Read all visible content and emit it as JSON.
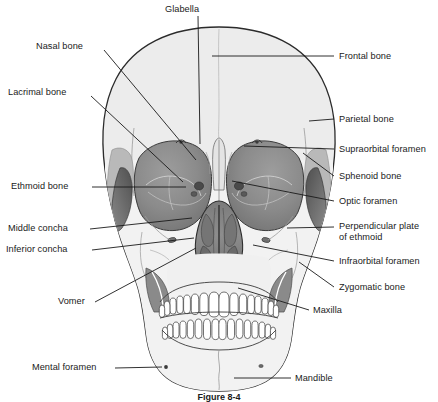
{
  "figure": {
    "caption": "Figure  8-4",
    "caption_cont": ""
  },
  "colors": {
    "outline": "#2b2b2b",
    "cranium_fill": "#ececec",
    "face_fill": "#f1f1f1",
    "orbit_fill": "#8e8e8e",
    "orbit_fill_dark": "#6f6f6f",
    "nasal_fill": "#8a8a8a",
    "nasal_fill_dark": "#5f5f5f",
    "sphenoid_fill": "#6b6b6b",
    "suture": "#9a9a9a",
    "leader": "#1a1a1a",
    "text": "#1a1a1a",
    "tooth_fill": "#ffffff"
  },
  "labels": [
    {
      "id": "glabella",
      "text": "Glabella",
      "side": "center",
      "x": 165,
      "y": 4,
      "lx": 198,
      "ly": 16,
      "tx": 200,
      "ty": 144
    },
    {
      "id": "nasal-bone",
      "text": "Nasal bone",
      "side": "left",
      "x": 36,
      "y": 41,
      "lx": 104,
      "ly": 50,
      "tx": 196,
      "ty": 160
    },
    {
      "id": "lacrimal-bone",
      "text": "Lacrimal bone",
      "side": "left",
      "x": 8,
      "y": 87,
      "lx": 91,
      "ly": 96,
      "tx": 183,
      "ty": 182
    },
    {
      "id": "ethmoid-bone",
      "text": "Ethmoid bone",
      "side": "left",
      "x": 11,
      "y": 181,
      "lx": 92,
      "ly": 187,
      "tx": 186,
      "ty": 187
    },
    {
      "id": "middle-concha",
      "text": "Middle concha",
      "side": "left",
      "x": 8,
      "y": 223,
      "lx": 90,
      "ly": 229,
      "tx": 192,
      "ty": 218
    },
    {
      "id": "inferior-concha",
      "text": "Inferior concha",
      "side": "left",
      "x": 6,
      "y": 244,
      "lx": 92,
      "ly": 250,
      "tx": 194,
      "ty": 238
    },
    {
      "id": "vomer",
      "text": "Vomer",
      "side": "left",
      "x": 58,
      "y": 296,
      "lx": 95,
      "ly": 302,
      "tx": 196,
      "ty": 248
    },
    {
      "id": "mental-foramen",
      "text": "Mental foramen",
      "side": "left",
      "x": 32,
      "y": 362,
      "lx": 115,
      "ly": 368,
      "tx": 162,
      "ly2": 368,
      "ty": 367
    },
    {
      "id": "frontal-bone",
      "text": "Frontal bone",
      "side": "right",
      "x": 339,
      "y": 51,
      "lx": 334,
      "ly": 56,
      "tx": 212,
      "ty": 56
    },
    {
      "id": "parietal-bone",
      "text": "Parietal bone",
      "side": "right",
      "x": 339,
      "y": 114,
      "lx": 334,
      "ly": 119,
      "tx": 309,
      "ty": 121
    },
    {
      "id": "supraorbital-foramen",
      "text": "Supraorbital foramen",
      "side": "right",
      "x": 339,
      "y": 144,
      "lx": 334,
      "ly": 149,
      "tx": 244,
      "ty": 146
    },
    {
      "id": "sphenoid-bone",
      "text": "Sphenoid bone",
      "side": "right",
      "x": 339,
      "y": 171,
      "lx": 334,
      "ly": 176,
      "tx": 303,
      "ty": 153
    },
    {
      "id": "optic-foramen",
      "text": "Optic foramen",
      "side": "right",
      "x": 339,
      "y": 196,
      "lx": 334,
      "ly": 201,
      "tx": 232,
      "ty": 181
    },
    {
      "id": "perpendicular-plate",
      "text": "Perpendicular plate",
      "text2": "of ethmoid",
      "side": "right",
      "x": 339,
      "y": 221,
      "lx": 334,
      "ly": 227,
      "tx": 287,
      "ty": 228
    },
    {
      "id": "infraorbital-foramen",
      "text": "Infraorbital foramen",
      "side": "right",
      "x": 339,
      "y": 256,
      "lx": 334,
      "ly": 261,
      "tx": 253,
      "ty": 245
    },
    {
      "id": "zygomatic-bone",
      "text": "Zygomatic bone",
      "side": "right",
      "x": 339,
      "y": 282,
      "lx": 334,
      "ly": 287,
      "tx": 299,
      "ty": 262
    },
    {
      "id": "maxilla",
      "text": "Maxilla",
      "side": "right",
      "x": 313,
      "y": 305,
      "lx": 309,
      "ly": 310,
      "tx": 238,
      "ty": 288
    },
    {
      "id": "mandible",
      "text": "Mandible",
      "side": "right",
      "x": 295,
      "y": 373,
      "lx": 291,
      "ly": 378,
      "tx": 234,
      "ty": 378
    }
  ]
}
